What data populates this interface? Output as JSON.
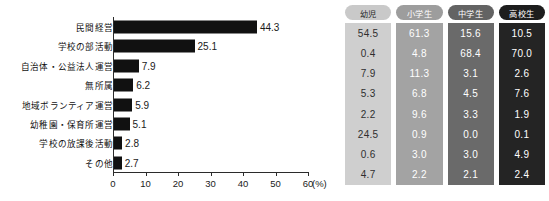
{
  "chart_data": {
    "type": "bar",
    "orientation": "horizontal",
    "title": "",
    "xlabel": "(%)",
    "ylabel": "",
    "xlim": [
      0,
      60
    ],
    "xticks": [
      "0",
      "10",
      "20",
      "30",
      "40",
      "50",
      "60"
    ],
    "unit_label": "(%)",
    "grid": false,
    "bar_color": "#111111",
    "categories": [
      "民間経営",
      "学校の部活動",
      "自治体・公益法人運営",
      "無所属",
      "地域ボランティア運営",
      "幼稚園・保育所運営",
      "学校の放課後活動",
      "その他"
    ],
    "values": [
      44.3,
      25.1,
      7.9,
      6.2,
      5.9,
      5.1,
      2.8,
      2.7
    ],
    "value_labels": [
      "44.3",
      "25.1",
      "7.9",
      "6.2",
      "5.9",
      "5.1",
      "2.8",
      "2.7"
    ]
  },
  "table": {
    "columns": [
      {
        "header": "幼児",
        "header_bg": "#c9c9c9",
        "body_bg": "#cfcfcf",
        "values": [
          "54.5",
          "0.4",
          "7.9",
          "5.3",
          "2.2",
          "24.5",
          "0.6",
          "4.7"
        ]
      },
      {
        "header": "小学生",
        "header_bg": "#9d9d9d",
        "body_bg": "#a3a3a3",
        "values": [
          "61.3",
          "4.8",
          "11.3",
          "6.8",
          "9.6",
          "0.9",
          "3.0",
          "2.2"
        ]
      },
      {
        "header": "中学生",
        "header_bg": "#636363",
        "body_bg": "#6a6a6a",
        "values": [
          "15.6",
          "68.4",
          "3.1",
          "4.5",
          "3.3",
          "0.0",
          "3.0",
          "2.1"
        ]
      },
      {
        "header": "高校生",
        "header_bg": "#1d1d1d",
        "body_bg": "#242424",
        "values": [
          "10.5",
          "70.0",
          "2.6",
          "7.6",
          "1.9",
          "0.1",
          "4.9",
          "2.4"
        ]
      }
    ]
  }
}
